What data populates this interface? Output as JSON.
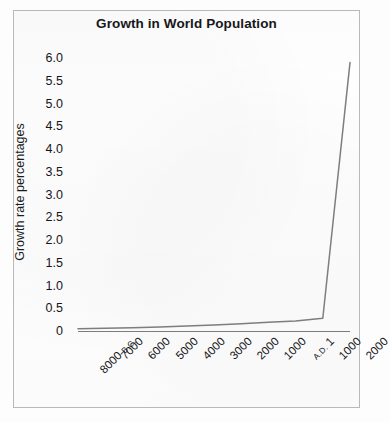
{
  "figure": {
    "frame_color": "#b9b9b9",
    "background_color": "#fefefe"
  },
  "chart_data": {
    "type": "line",
    "title": "Growth in World Population",
    "xlabel": "",
    "ylabel": "Growth rate percentages",
    "grid": false,
    "legend": false,
    "legend_position": "none",
    "line_color": "#7d7d82",
    "axis_color": "#7b7b80",
    "ylim": [
      0,
      6.0
    ],
    "ytick_labels": [
      "6.0",
      "5.5",
      "5.0",
      "4.5",
      "4.0",
      "3.5",
      "3.0",
      "2.5",
      "2.0",
      "1.5",
      "1.0",
      "0.5",
      "0"
    ],
    "ytick_values": [
      6.0,
      5.5,
      5.0,
      4.5,
      4.0,
      3.5,
      3.0,
      2.5,
      2.0,
      1.5,
      1.0,
      0.5,
      0
    ],
    "xtick_labels": [
      "8000 B.C.",
      "7000",
      "6000",
      "5000",
      "4000",
      "3000",
      "2000",
      "1000",
      "A.D. 1",
      "1000",
      "2000"
    ],
    "xtick_label_parts": [
      {
        "main": "8000",
        "era": "B.C."
      },
      {
        "main": "7000",
        "era": ""
      },
      {
        "main": "6000",
        "era": ""
      },
      {
        "main": "5000",
        "era": ""
      },
      {
        "main": "4000",
        "era": ""
      },
      {
        "main": "3000",
        "era": ""
      },
      {
        "main": "2000",
        "era": ""
      },
      {
        "main": "1000",
        "era": ""
      },
      {
        "main": "1",
        "era": "A.D.",
        "era_before": true
      },
      {
        "main": "1000",
        "era": ""
      },
      {
        "main": "2000",
        "era": ""
      }
    ],
    "categories": [
      "8000 B.C.",
      "7000 B.C.",
      "6000 B.C.",
      "5000 B.C.",
      "4000 B.C.",
      "3000 B.C.",
      "2000 B.C.",
      "1000 B.C.",
      "A.D. 1",
      "A.D. 1000",
      "A.D. 2000"
    ],
    "x": [
      0,
      1,
      2,
      3,
      4,
      5,
      6,
      7,
      8,
      9,
      10
    ],
    "values": [
      0.05,
      0.06,
      0.07,
      0.09,
      0.11,
      0.13,
      0.16,
      0.19,
      0.22,
      0.28,
      5.9
    ],
    "annotations": [
      {
        "text": "Curve is nearly flat just above zero from 8000 B.C. through A.D. 1000, then rises almost vertically to its peak at A.D. 2000."
      }
    ],
    "peak_value": 5.9,
    "peak_category": "A.D. 2000"
  }
}
